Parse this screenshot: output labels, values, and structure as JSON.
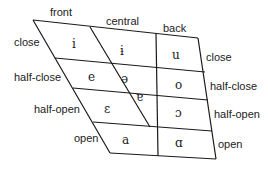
{
  "diagram": {
    "line_color": "#1a1a1a",
    "text_color": "#222222",
    "columns": {
      "front": "front",
      "central": "central",
      "back": "back"
    },
    "rows_left": {
      "close": "close",
      "half_close": "half-close",
      "half_open": "half-open",
      "open": "open"
    },
    "rows_right": {
      "close": "close",
      "half_close": "half-close",
      "half_open": "half-open",
      "open": "open"
    },
    "vowels": {
      "front_close": "i",
      "central_close": "ɨ",
      "back_close": "u",
      "front_half_close": "e",
      "central_half_close": "ə",
      "back_half_close": "o",
      "central_half_open": "ɐ",
      "front_half_open": "ε",
      "back_half_open": "ɔ",
      "front_open": "a",
      "back_open": "ɑ"
    }
  }
}
